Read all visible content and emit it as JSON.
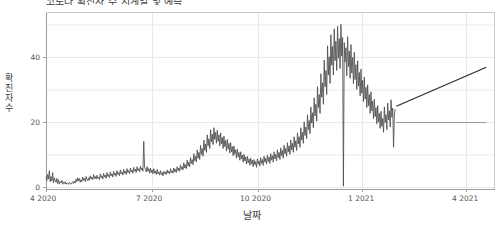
{
  "chart": {
    "title": "코로나 확진자 수 시계열 및 예측",
    "title_clipped": true,
    "y_axis_label_lines": [
      "확",
      "진",
      "자",
      " ",
      "수"
    ],
    "y_axis_label": "확진자 수",
    "x_axis_label": "날짜",
    "line_color": "#4d4d4d",
    "grid_color": "#e8e8e8",
    "axis_color": "#9a9a9a",
    "background": "#ffffff",
    "y_ticks": [
      "0",
      "20",
      "40"
    ],
    "x_ticks": [
      "4 2020",
      "7 2020",
      "10 2020",
      "1 2021",
      "4 2021"
    ]
  },
  "chart_data": {
    "type": "line",
    "title": "코로나 확진자 수 시계열 및 예측",
    "xlabel": "날짜",
    "ylabel": "확진자 수",
    "xlim": [
      "2020-04-01",
      "2021-05-20"
    ],
    "ylim": [
      -2,
      54
    ],
    "grid": true,
    "legend": "none",
    "x_tick_labels": [
      "4 2020",
      "7 2020",
      "10 2020",
      "1 2021",
      "4 2021"
    ],
    "x_tick_positions": [
      "2020-04-01",
      "2020-07-01",
      "2020-10-01",
      "2021-01-01",
      "2021-04-01"
    ],
    "y_tick_labels": [
      "0",
      "20",
      "40"
    ],
    "y_tick_values": [
      0,
      20,
      40
    ],
    "series": [
      {
        "name": "확진자 수",
        "type": "line",
        "color": "#4d4d4d",
        "x_start": "2020-04-01",
        "x_end": "2021-02-17",
        "values": [
          3.2,
          2.1,
          4.0,
          2.6,
          5.2,
          1.8,
          3.4,
          2.0,
          4.6,
          1.4,
          3.0,
          2.2,
          1.6,
          2.8,
          1.2,
          2.4,
          1.0,
          1.8,
          1.4,
          2.2,
          1.0,
          1.6,
          1.2,
          1.8,
          1.0,
          1.4,
          1.2,
          1.0,
          1.6,
          1.2,
          1.0,
          1.4,
          1.8,
          1.2,
          2.0,
          1.4,
          2.6,
          1.8,
          3.0,
          2.0,
          2.8,
          1.6,
          2.4,
          1.8,
          3.2,
          2.2,
          2.8,
          1.8,
          3.4,
          2.4,
          2.0,
          3.0,
          2.2,
          3.6,
          2.6,
          3.2,
          2.4,
          4.0,
          2.8,
          3.4,
          2.6,
          3.8,
          2.8,
          3.2,
          2.4,
          4.2,
          3.0,
          3.6,
          2.6,
          4.4,
          3.2,
          3.8,
          2.8,
          4.6,
          3.4,
          4.0,
          3.0,
          4.8,
          3.6,
          4.2,
          3.2,
          5.0,
          3.8,
          4.4,
          3.4,
          5.2,
          4.0,
          4.6,
          3.6,
          5.4,
          4.2,
          4.8,
          3.8,
          5.6,
          4.4,
          5.0,
          4.0,
          5.8,
          4.6,
          5.2,
          4.2,
          6.0,
          4.8,
          5.4,
          4.4,
          6.2,
          5.0,
          5.6,
          4.6,
          6.4,
          5.2,
          5.8,
          4.8,
          6.6,
          5.4,
          6.0,
          5.0,
          14.2,
          6.2,
          5.6,
          4.8,
          6.4,
          5.0,
          5.8,
          4.4,
          6.0,
          4.6,
          5.4,
          4.2,
          5.8,
          4.4,
          5.0,
          4.0,
          5.6,
          4.2,
          4.8,
          3.8,
          5.2,
          4.0,
          4.6,
          3.6,
          5.0,
          4.2,
          4.8,
          4.0,
          5.4,
          4.4,
          5.0,
          4.2,
          5.8,
          4.6,
          5.2,
          4.4,
          6.0,
          4.8,
          5.6,
          4.6,
          6.4,
          5.2,
          6.0,
          5.0,
          7.0,
          5.6,
          6.4,
          5.4,
          7.6,
          6.0,
          7.0,
          5.8,
          8.4,
          6.6,
          7.8,
          6.4,
          9.2,
          7.4,
          8.6,
          7.0,
          10.4,
          8.2,
          9.6,
          7.8,
          11.6,
          9.0,
          10.8,
          8.6,
          13.0,
          10.2,
          12.0,
          9.6,
          14.6,
          11.4,
          13.4,
          10.8,
          16.2,
          12.8,
          15.0,
          12.0,
          17.8,
          14.0,
          16.4,
          13.2,
          18.4,
          14.8,
          17.0,
          13.6,
          17.6,
          14.2,
          16.2,
          12.8,
          16.8,
          13.4,
          15.4,
          12.0,
          15.8,
          12.6,
          14.4,
          11.2,
          14.8,
          11.8,
          13.6,
          10.6,
          13.8,
          11.0,
          12.6,
          9.8,
          12.8,
          10.2,
          11.6,
          9.0,
          11.8,
          9.4,
          10.8,
          8.4,
          11.0,
          8.8,
          10.0,
          7.8,
          10.2,
          8.2,
          9.4,
          7.2,
          9.6,
          7.6,
          8.8,
          6.8,
          9.0,
          7.2,
          8.4,
          6.4,
          8.6,
          7.0,
          8.0,
          6.2,
          8.8,
          7.2,
          8.2,
          6.6,
          9.2,
          7.4,
          8.6,
          6.8,
          9.6,
          7.8,
          9.0,
          7.2,
          10.0,
          8.0,
          9.4,
          7.4,
          10.4,
          8.4,
          9.8,
          7.8,
          11.0,
          8.8,
          10.2,
          8.2,
          11.6,
          9.2,
          10.8,
          8.6,
          12.2,
          9.8,
          11.4,
          9.0,
          13.0,
          10.4,
          12.0,
          9.6,
          13.8,
          11.0,
          12.8,
          10.2,
          14.6,
          11.6,
          13.6,
          10.8,
          15.6,
          12.4,
          14.4,
          11.4,
          16.8,
          13.4,
          15.6,
          12.4,
          18.4,
          14.6,
          17.0,
          13.6,
          20.2,
          16.0,
          18.6,
          15.0,
          22.4,
          17.8,
          20.6,
          16.6,
          24.8,
          19.8,
          23.0,
          18.4,
          27.6,
          22.0,
          25.6,
          20.4,
          31.0,
          24.6,
          28.6,
          22.8,
          35.0,
          27.8,
          32.2,
          25.6,
          39.2,
          31.0,
          36.0,
          28.6,
          43.6,
          34.6,
          40.2,
          32.0,
          47.0,
          37.6,
          43.4,
          34.6,
          48.8,
          39.0,
          45.0,
          36.0,
          49.6,
          39.8,
          45.8,
          36.6,
          50.2,
          40.4,
          46.2,
          0.4,
          44.6,
          38.6,
          43.0,
          34.4,
          46.4,
          37.2,
          42.0,
          33.6,
          44.0,
          35.2,
          40.0,
          32.0,
          41.6,
          33.2,
          37.8,
          30.2,
          39.0,
          31.2,
          35.4,
          28.2,
          36.4,
          29.0,
          33.0,
          26.4,
          34.0,
          27.2,
          30.8,
          24.6,
          31.6,
          25.2,
          28.6,
          22.8,
          29.4,
          23.6,
          26.6,
          21.2,
          27.2,
          21.8,
          24.6,
          19.6,
          25.2,
          20.2,
          22.8,
          18.2,
          23.4,
          18.8,
          21.2,
          17.0,
          24.8,
          20.0,
          22.4,
          17.8,
          26.0,
          20.8,
          23.6,
          18.6,
          27.0,
          21.6,
          24.4,
          12.4,
          22.6,
          24.0
        ]
      },
      {
        "name": "예측 추세선 (상승)",
        "type": "trend-line",
        "color": "#2e2e2e",
        "x_start": "2021-02-18",
        "x_end": "2021-05-12",
        "y_start": 25.0,
        "y_end": 37.0
      },
      {
        "name": "예측 기준선 (수평)",
        "type": "trend-line",
        "color": "#9a9a9a",
        "x_start": "2021-02-18",
        "x_end": "2021-05-12",
        "y_start": 20.0,
        "y_end": 20.0
      }
    ],
    "annotations": [
      {
        "text": "2020-12말 최고점 약 50",
        "value": 50.2
      },
      {
        "text": "단일일 급락 지점 약 0",
        "value": 0.4
      },
      {
        "text": "2020-08말 1차 증가 약 18",
        "value": 18.4
      }
    ]
  }
}
